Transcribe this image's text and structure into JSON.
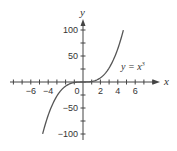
{
  "chart_data": {
    "type": "line",
    "title": "",
    "xlabel": "x",
    "ylabel": "y",
    "xlim": [
      -8,
      8
    ],
    "ylim": [
      -100,
      100
    ],
    "x_ticks": [
      -6,
      -4,
      0,
      2,
      4,
      6
    ],
    "x_tick_labels": [
      "−6",
      "−4",
      "0",
      "2",
      "4",
      "6"
    ],
    "y_ticks": [
      100,
      50,
      -50,
      -100
    ],
    "y_tick_labels": [
      "100",
      "50",
      "−50",
      "−100"
    ],
    "grid": false,
    "series": [
      {
        "name": "y = x^3",
        "function": "x^3",
        "x_range": [
          -4.64,
          4.64
        ],
        "x": [
          -4.64,
          -4,
          -3,
          -2,
          -1,
          0,
          1,
          2,
          3,
          4,
          4.64
        ],
        "y": [
          -100,
          -64,
          -27,
          -8,
          -1,
          0,
          1,
          8,
          27,
          64,
          100
        ]
      }
    ],
    "annotations": [
      {
        "text": "y = x³",
        "x": 4.2,
        "y": 35
      }
    ]
  },
  "labels": {
    "x_axis": "x",
    "y_axis": "y",
    "equation_main": "y = x",
    "equation_exp": "3"
  }
}
